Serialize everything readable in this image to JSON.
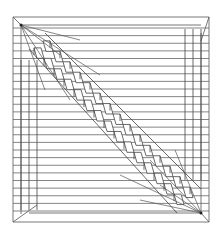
{
  "figure": {
    "stroke_color": "#555555",
    "dark_stroke_color": "#222222",
    "background": "#ffffff",
    "outer_square": {
      "x1": 13,
      "y1": 17,
      "x2": 209,
      "y2": 222
    },
    "inner_square": {
      "x1": 21,
      "y1": 25,
      "x2": 201,
      "y2": 213
    },
    "focal_points": [
      {
        "name": "top-left",
        "x": 21,
        "y": 25
      },
      {
        "name": "bottom-right",
        "x": 201,
        "y": 213
      }
    ]
  }
}
